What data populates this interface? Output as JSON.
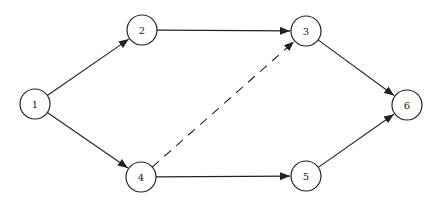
{
  "diagram": {
    "type": "network-activity-graph",
    "nodes": [
      {
        "id": "1",
        "label": "1",
        "x": 35,
        "y": 104
      },
      {
        "id": "2",
        "label": "2",
        "x": 142,
        "y": 30
      },
      {
        "id": "3",
        "label": "3",
        "x": 306,
        "y": 31
      },
      {
        "id": "4",
        "label": "4",
        "x": 141,
        "y": 177
      },
      {
        "id": "5",
        "label": "5",
        "x": 306,
        "y": 176
      },
      {
        "id": "6",
        "label": "6",
        "x": 407,
        "y": 105
      }
    ],
    "edges": [
      {
        "from": "1",
        "to": "2",
        "style": "solid"
      },
      {
        "from": "1",
        "to": "4",
        "style": "solid"
      },
      {
        "from": "2",
        "to": "3",
        "style": "solid"
      },
      {
        "from": "4",
        "to": "3",
        "style": "dashed"
      },
      {
        "from": "4",
        "to": "5",
        "style": "solid"
      },
      {
        "from": "3",
        "to": "6",
        "style": "solid"
      },
      {
        "from": "5",
        "to": "6",
        "style": "solid"
      }
    ]
  }
}
